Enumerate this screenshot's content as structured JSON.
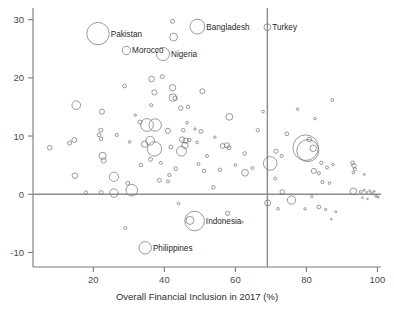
{
  "chart_data": {
    "type": "scatter",
    "title": "",
    "subtitle": "",
    "xlabel": "Overall Financial Inclusion in 2017 (%)",
    "ylabel": "",
    "xlim": [
      3,
      101
    ],
    "ylim": [
      -12.5,
      32
    ],
    "xticks": [
      20,
      40,
      60,
      80,
      100
    ],
    "yticks": [
      30,
      20,
      10,
      0,
      -10
    ],
    "xtick_labels": [
      "20",
      "40",
      "60",
      "80",
      "100"
    ],
    "ytick_labels": [
      "30",
      "20",
      "10",
      "0",
      "-10"
    ],
    "grid": false,
    "legend": "none",
    "marker_style": "open-circle",
    "size_encoding": "bubble area proportional to population",
    "reference_lines": [
      {
        "orientation": "horizontal",
        "value": 0,
        "color": "#8c8c8c"
      },
      {
        "orientation": "vertical",
        "value": 69,
        "color": "#8c8c8c"
      }
    ],
    "annotations": [
      {
        "label": "Pakistan",
        "x": 21.3,
        "y": 27.6
      },
      {
        "label": "Morocco",
        "x": 29.3,
        "y": 24.7
      },
      {
        "label": "Nigeria",
        "x": 39.6,
        "y": 24.1
      },
      {
        "label": "Bangladesh",
        "x": 49.3,
        "y": 28.8
      },
      {
        "label": "Turkey",
        "x": 69.0,
        "y": 28.7
      },
      {
        "label": "Indonesia",
        "x": 48.5,
        "y": -4.6
      },
      {
        "label": "Philippines",
        "x": 34.6,
        "y": -9.2
      }
    ],
    "points": [
      {
        "x": 21.3,
        "y": 27.6,
        "r": 11.2,
        "label": "Pakistan"
      },
      {
        "x": 29.3,
        "y": 24.7,
        "r": 4.2,
        "label": "Morocco"
      },
      {
        "x": 39.6,
        "y": 24.1,
        "r": 6.6,
        "label": "Nigeria"
      },
      {
        "x": 49.3,
        "y": 28.8,
        "r": 7.4,
        "label": "Bangladesh"
      },
      {
        "x": 69.0,
        "y": 28.7,
        "r": 3.4,
        "label": "Turkey"
      },
      {
        "x": 48.5,
        "y": -4.6,
        "r": 9.8,
        "label": "Indonesia"
      },
      {
        "x": 34.6,
        "y": -9.2,
        "r": 6.2,
        "label": "Philippines"
      },
      {
        "x": 42.3,
        "y": 29.7,
        "r": 2.0
      },
      {
        "x": 42.6,
        "y": 27.0,
        "r": 3.9
      },
      {
        "x": 36.4,
        "y": 19.8,
        "r": 2.8
      },
      {
        "x": 39.4,
        "y": 20.2,
        "r": 2.0
      },
      {
        "x": 42.3,
        "y": 18.3,
        "r": 3.2
      },
      {
        "x": 37.2,
        "y": 17.5,
        "r": 2.6
      },
      {
        "x": 42.4,
        "y": 16.6,
        "r": 3.8
      },
      {
        "x": 43.0,
        "y": 16.5,
        "r": 2.2
      },
      {
        "x": 28.8,
        "y": 18.6,
        "r": 1.9
      },
      {
        "x": 36.3,
        "y": 15.3,
        "r": 1.6
      },
      {
        "x": 50.7,
        "y": 17.7,
        "r": 2.5
      },
      {
        "x": 46.7,
        "y": 15.0,
        "r": 1.7
      },
      {
        "x": 44.6,
        "y": 14.8,
        "r": 2.2
      },
      {
        "x": 15.2,
        "y": 15.3,
        "r": 4.3
      },
      {
        "x": 22.4,
        "y": 14.2,
        "r": 2.6
      },
      {
        "x": 58.3,
        "y": 13.3,
        "r": 3.4
      },
      {
        "x": 33.1,
        "y": 12.4,
        "r": 2.1
      },
      {
        "x": 35.1,
        "y": 11.9,
        "r": 6.4
      },
      {
        "x": 37.4,
        "y": 11.9,
        "r": 6.2
      },
      {
        "x": 22.1,
        "y": 11.0,
        "r": 2.0
      },
      {
        "x": 21.6,
        "y": 10.2,
        "r": 1.8
      },
      {
        "x": 26.6,
        "y": 10.2,
        "r": 1.6
      },
      {
        "x": 41.0,
        "y": 10.9,
        "r": 2.6
      },
      {
        "x": 45.3,
        "y": 11.0,
        "r": 1.8
      },
      {
        "x": 50.3,
        "y": 10.8,
        "r": 2.0
      },
      {
        "x": 74.5,
        "y": 10.4,
        "r": 1.9
      },
      {
        "x": 66.3,
        "y": 11.0,
        "r": 1.7
      },
      {
        "x": 79.8,
        "y": 8.0,
        "r": 12.8
      },
      {
        "x": 80.4,
        "y": 7.5,
        "r": 11.0
      },
      {
        "x": 80.8,
        "y": 9.4,
        "r": 2.3
      },
      {
        "x": 81.9,
        "y": 7.9,
        "r": 3.3
      },
      {
        "x": 45.0,
        "y": 9.4,
        "r": 2.7
      },
      {
        "x": 46.0,
        "y": 9.2,
        "r": 2.6
      },
      {
        "x": 45.8,
        "y": 8.4,
        "r": 3.2
      },
      {
        "x": 47.0,
        "y": 9.3,
        "r": 1.8
      },
      {
        "x": 49.2,
        "y": 8.9,
        "r": 1.4
      },
      {
        "x": 56.4,
        "y": 8.3,
        "r": 2.4
      },
      {
        "x": 57.6,
        "y": 8.4,
        "r": 2.6
      },
      {
        "x": 58.2,
        "y": 8.0,
        "r": 2.0
      },
      {
        "x": 36.0,
        "y": 9.2,
        "r": 4.4
      },
      {
        "x": 34.4,
        "y": 8.6,
        "r": 3.2
      },
      {
        "x": 37.2,
        "y": 7.8,
        "r": 7.2
      },
      {
        "x": 44.8,
        "y": 7.4,
        "r": 4.9
      },
      {
        "x": 41.8,
        "y": 8.1,
        "r": 1.9
      },
      {
        "x": 14.6,
        "y": 9.3,
        "r": 2.5
      },
      {
        "x": 13.3,
        "y": 8.8,
        "r": 2.0
      },
      {
        "x": 7.7,
        "y": 8.0,
        "r": 2.3
      },
      {
        "x": 22.2,
        "y": 9.5,
        "r": 1.8
      },
      {
        "x": 22.6,
        "y": 6.6,
        "r": 3.6
      },
      {
        "x": 22.9,
        "y": 5.8,
        "r": 2.6
      },
      {
        "x": 62.6,
        "y": 7.0,
        "r": 1.8
      },
      {
        "x": 69.8,
        "y": 5.3,
        "r": 6.8
      },
      {
        "x": 67.8,
        "y": 14.2,
        "r": 1.3
      },
      {
        "x": 71.4,
        "y": 7.4,
        "r": 2.1
      },
      {
        "x": 73.0,
        "y": 6.6,
        "r": 1.6
      },
      {
        "x": 77.5,
        "y": 14.6,
        "r": 1.2
      },
      {
        "x": 87.3,
        "y": 16.2,
        "r": 1.5
      },
      {
        "x": 82.4,
        "y": 13.0,
        "r": 1.3
      },
      {
        "x": 84.2,
        "y": 5.4,
        "r": 1.7
      },
      {
        "x": 85.8,
        "y": 4.6,
        "r": 1.5
      },
      {
        "x": 83.5,
        "y": 3.6,
        "r": 1.6
      },
      {
        "x": 82.1,
        "y": 4.0,
        "r": 2.6
      },
      {
        "x": 87.5,
        "y": 5.1,
        "r": 1.2
      },
      {
        "x": 93.0,
        "y": 5.4,
        "r": 1.9
      },
      {
        "x": 93.4,
        "y": 4.9,
        "r": 2.2
      },
      {
        "x": 93.6,
        "y": 4.3,
        "r": 1.6
      },
      {
        "x": 93.2,
        "y": 3.7,
        "r": 1.3
      },
      {
        "x": 96.3,
        "y": 3.4,
        "r": 1.0
      },
      {
        "x": 36.1,
        "y": 6.0,
        "r": 2.0
      },
      {
        "x": 39.0,
        "y": 5.4,
        "r": 1.5
      },
      {
        "x": 43.2,
        "y": 4.4,
        "r": 1.9
      },
      {
        "x": 49.6,
        "y": 5.2,
        "r": 1.5
      },
      {
        "x": 51.2,
        "y": 4.0,
        "r": 1.8
      },
      {
        "x": 55.6,
        "y": 4.2,
        "r": 1.7
      },
      {
        "x": 62.7,
        "y": 3.7,
        "r": 3.4
      },
      {
        "x": 41.4,
        "y": 3.3,
        "r": 1.6
      },
      {
        "x": 38.6,
        "y": 2.4,
        "r": 2.0
      },
      {
        "x": 41.0,
        "y": 2.2,
        "r": 1.5
      },
      {
        "x": 25.8,
        "y": 3.0,
        "r": 4.6
      },
      {
        "x": 14.8,
        "y": 3.2,
        "r": 2.8
      },
      {
        "x": 53.8,
        "y": 1.2,
        "r": 1.8
      },
      {
        "x": 29.7,
        "y": 1.9,
        "r": 1.9
      },
      {
        "x": 30.8,
        "y": 0.7,
        "r": 5.8
      },
      {
        "x": 25.8,
        "y": 0.2,
        "r": 4.2
      },
      {
        "x": 22.2,
        "y": 0.3,
        "r": 2.0
      },
      {
        "x": 73.2,
        "y": 0.4,
        "r": 2.3
      },
      {
        "x": 75.8,
        "y": -1.0,
        "r": 4.2
      },
      {
        "x": 81.5,
        "y": -0.4,
        "r": 1.2
      },
      {
        "x": 84.5,
        "y": 2.1,
        "r": 1.6
      },
      {
        "x": 86.5,
        "y": 1.9,
        "r": 1.3
      },
      {
        "x": 93.2,
        "y": 0.5,
        "r": 3.3
      },
      {
        "x": 95.3,
        "y": 0.4,
        "r": 1.4
      },
      {
        "x": 96.2,
        "y": 0.7,
        "r": 1.1
      },
      {
        "x": 97.0,
        "y": 0.3,
        "r": 1.0
      },
      {
        "x": 97.8,
        "y": 0.6,
        "r": 0.9
      },
      {
        "x": 98.4,
        "y": 0.2,
        "r": 1.2
      },
      {
        "x": 99.1,
        "y": 0.5,
        "r": 0.9
      },
      {
        "x": 99.6,
        "y": -0.3,
        "r": 1.3
      },
      {
        "x": 95.8,
        "y": -0.6,
        "r": 0.9
      },
      {
        "x": 97.2,
        "y": -0.8,
        "r": 0.8
      },
      {
        "x": 100.2,
        "y": -0.5,
        "r": 1.0
      },
      {
        "x": 71.2,
        "y": 2.7,
        "r": 1.5
      },
      {
        "x": 69.1,
        "y": -1.5,
        "r": 3.0
      },
      {
        "x": 72.0,
        "y": -2.5,
        "r": 1.3
      },
      {
        "x": 79.6,
        "y": -2.5,
        "r": 1.2
      },
      {
        "x": 83.5,
        "y": -2.2,
        "r": 1.9
      },
      {
        "x": 85.4,
        "y": -2.6,
        "r": 1.1
      },
      {
        "x": 88.3,
        "y": -3.0,
        "r": 1.0
      },
      {
        "x": 87.0,
        "y": -4.3,
        "r": 0.9
      },
      {
        "x": 44.0,
        "y": -1.6,
        "r": 1.4
      },
      {
        "x": 57.8,
        "y": -3.3,
        "r": 2.1
      },
      {
        "x": 62.0,
        "y": -4.8,
        "r": 0.9
      },
      {
        "x": 29.0,
        "y": -5.8,
        "r": 1.6
      },
      {
        "x": 47.2,
        "y": -4.5,
        "r": 4.0
      },
      {
        "x": 17.9,
        "y": 0.3,
        "r": 1.6
      },
      {
        "x": 54.2,
        "y": 9.8,
        "r": 1.3
      },
      {
        "x": 52.0,
        "y": 6.6,
        "r": 1.5
      },
      {
        "x": 60.0,
        "y": 5.0,
        "r": 1.4
      },
      {
        "x": 64.8,
        "y": 4.5,
        "r": 1.5
      },
      {
        "x": 46.4,
        "y": 12.3,
        "r": 1.4
      },
      {
        "x": 48.6,
        "y": 11.2,
        "r": 1.2
      },
      {
        "x": 31.8,
        "y": 13.6,
        "r": 1.2
      },
      {
        "x": 33.4,
        "y": 5.0,
        "r": 1.8
      },
      {
        "x": 30.2,
        "y": 9.0,
        "r": 1.3
      }
    ]
  },
  "figure": {
    "axis_color": "#7a7a7a",
    "marker_color": "#6f6f6f",
    "text_color": "#2e2e2e",
    "background": "#ffffff"
  }
}
